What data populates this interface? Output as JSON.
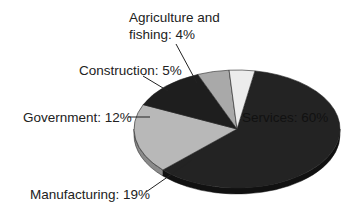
{
  "chart_data": {
    "type": "pie",
    "style": "3d-exploded-free",
    "title": "",
    "unit": "%",
    "categories": [
      "Services",
      "Manufacturing",
      "Government",
      "Construction",
      "Agriculture and fishing"
    ],
    "values": [
      60,
      19,
      12,
      5,
      4
    ],
    "labels": [
      {
        "text": "Services: 60%",
        "placement": "inside"
      },
      {
        "text": "Manufacturing: 19%",
        "placement": "outside-bottom-left"
      },
      {
        "text": "Government: 12%",
        "placement": "outside-left"
      },
      {
        "text": "Construction: 5%",
        "placement": "outside-top-left"
      },
      {
        "text": "Agriculture and fishing: 4%",
        "lines": [
          "Agriculture and",
          "fishing: 4%"
        ],
        "placement": "outside-top"
      }
    ],
    "colors": {
      "Services": {
        "top": "#232323",
        "side": "#111111"
      },
      "Manufacturing": {
        "top": "#b8b8b8",
        "side": "#8a8a8a"
      },
      "Government": {
        "top": "#1e1e1e",
        "side": "#0e0e0e"
      },
      "Construction": {
        "top": "#a9a9a9",
        "side": "#7d7d7d"
      },
      "Agriculture and fishing": {
        "top": "#ececec",
        "side": "#c4c4c4"
      }
    },
    "legend": "none",
    "grid": false
  }
}
